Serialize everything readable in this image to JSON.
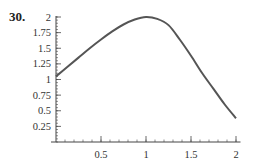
{
  "problem_number": "30.",
  "chart_data": {
    "type": "line",
    "title": "",
    "xlabel": "",
    "ylabel": "",
    "xlim": [
      0,
      2.05
    ],
    "ylim": [
      0,
      2.0
    ],
    "grid": false,
    "legend": null,
    "x_ticks": [
      0.5,
      1,
      1.5,
      2
    ],
    "x_tick_labels": [
      "0.5",
      "1",
      "1.5",
      "2"
    ],
    "y_ticks": [
      0.25,
      0.5,
      0.75,
      1,
      1.25,
      1.5,
      1.75,
      2
    ],
    "y_tick_labels": [
      "0.25",
      "0.5",
      "0.75",
      "1",
      "1.25",
      "1.5",
      "1.75",
      "2"
    ],
    "series": [
      {
        "name": "f(x)",
        "color": "#555555",
        "x": [
          0,
          0.125,
          0.25,
          0.375,
          0.5,
          0.625,
          0.75,
          0.875,
          1.0,
          1.125,
          1.25,
          1.375,
          1.5,
          1.625,
          1.75,
          1.875,
          2.0
        ],
        "values": [
          1.05,
          1.2,
          1.35,
          1.5,
          1.64,
          1.77,
          1.88,
          1.96,
          2.0,
          1.97,
          1.87,
          1.64,
          1.38,
          1.1,
          0.85,
          0.6,
          0.38
        ]
      }
    ]
  }
}
